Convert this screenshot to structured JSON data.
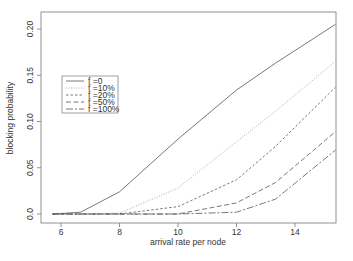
{
  "chart_data": {
    "type": "line",
    "title": "",
    "xlabel": "arrival rate per node",
    "ylabel": "blocking probability",
    "xlim": [
      5.4,
      15.4
    ],
    "ylim": [
      -0.008,
      0.22
    ],
    "x_ticks": [
      6,
      8,
      10,
      12,
      14
    ],
    "x_tick_labels": [
      "6",
      "8",
      "10",
      "12",
      "14"
    ],
    "y_ticks": [
      0.0,
      0.05,
      0.1,
      0.15,
      0.2
    ],
    "y_tick_labels": [
      "0.0",
      "0.05",
      "0.10",
      "0.15",
      "0.20"
    ],
    "grid": false,
    "legend_position": "upper left (inset)",
    "x": [
      5.71,
      6.67,
      8,
      10,
      12,
      13.33,
      15.38
    ],
    "series": [
      {
        "name": "f =0",
        "dash": "",
        "color": "#555555",
        "values": [
          0.0,
          0.002,
          0.024,
          0.081,
          0.134,
          0.163,
          0.205
        ]
      },
      {
        "name": "f =10%",
        "dash": "1,1.5",
        "color": "#999999",
        "values": [
          0.0,
          0.0,
          0.001,
          0.028,
          0.078,
          0.111,
          0.165
        ]
      },
      {
        "name": "f =20%",
        "dash": "2.5,2",
        "color": "#555555",
        "values": [
          0.0,
          0.0,
          0.0,
          0.008,
          0.037,
          0.073,
          0.137
        ]
      },
      {
        "name": "f =50%",
        "dash": "5,2.5",
        "color": "#555555",
        "values": [
          0.0,
          0.0,
          0.0,
          0.0,
          0.012,
          0.034,
          0.089
        ]
      },
      {
        "name": "f =100%",
        "dash": "7,2,2,2",
        "color": "#555555",
        "values": [
          0.0,
          0.0,
          0.0,
          0.0,
          0.002,
          0.016,
          0.069
        ]
      }
    ]
  }
}
